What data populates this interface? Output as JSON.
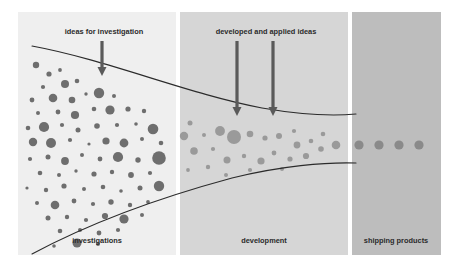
{
  "figure": {
    "background": "#ffffff"
  },
  "panels": [
    {
      "id": "investigations",
      "label": "investigations",
      "fill": "#efefef",
      "x": 0,
      "y": 0,
      "width": 158,
      "height": 243,
      "label_x": 79,
      "label_y": 231
    },
    {
      "id": "development",
      "label": "development",
      "fill": "#d6d6d6",
      "x": 162,
      "y": 0,
      "width": 168,
      "height": 243,
      "label_x": 246,
      "label_y": 231
    },
    {
      "id": "shipping-products",
      "label": "shipping products",
      "fill": "#bdbdbd",
      "x": 334,
      "y": 0,
      "width": 89,
      "height": 243,
      "label_x": 378,
      "label_y": 231
    }
  ],
  "annotations": [
    {
      "id": "ideas-for-investigation",
      "text": "ideas for investigation",
      "text_x": 86,
      "text_y": 22,
      "arrows": [
        {
          "x": 84,
          "y1": 29,
          "y2": 64
        }
      ]
    },
    {
      "id": "developed-and-applied-ideas",
      "text": "developed and applied ideas",
      "text_x": 248,
      "text_y": 22,
      "arrows": [
        {
          "x": 219,
          "y1": 29,
          "y2": 104
        },
        {
          "x": 255,
          "y1": 29,
          "y2": 104
        }
      ]
    }
  ],
  "funnel": {
    "stroke": "#2b2b2b",
    "stroke_width": 1.1,
    "top_curve": "M 14,34 C 90,48 170,82 244,96 C 290,104 316,104 338,102",
    "bottom_curve": "M 14,242 C 70,212 140,186 214,166 C 262,154 308,150 338,151"
  },
  "arrow_style": {
    "color": "#5a5a5a",
    "shaft_width": 3.2,
    "head_width": 9,
    "head_height": 9
  },
  "circles": {
    "investigations": {
      "fill": "#6e6e6e",
      "items": [
        {
          "cx": 18,
          "cy": 53,
          "r": 3.2
        },
        {
          "cx": 31,
          "cy": 62,
          "r": 2.6
        },
        {
          "cx": 42,
          "cy": 58,
          "r": 1.9
        },
        {
          "cx": 25,
          "cy": 75,
          "r": 2.1
        },
        {
          "cx": 47,
          "cy": 72,
          "r": 4.0
        },
        {
          "cx": 59,
          "cy": 69,
          "r": 2.3
        },
        {
          "cx": 14,
          "cy": 88,
          "r": 2.4
        },
        {
          "cx": 35,
          "cy": 86,
          "r": 4.3
        },
        {
          "cx": 54,
          "cy": 88,
          "r": 3.3
        },
        {
          "cx": 68,
          "cy": 82,
          "r": 1.7
        },
        {
          "cx": 81,
          "cy": 81,
          "r": 5.2
        },
        {
          "cx": 96,
          "cy": 84,
          "r": 2.0
        },
        {
          "cx": 20,
          "cy": 101,
          "r": 2.0
        },
        {
          "cx": 40,
          "cy": 100,
          "r": 2.4
        },
        {
          "cx": 57,
          "cy": 103,
          "r": 4.1
        },
        {
          "cx": 76,
          "cy": 97,
          "r": 2.3
        },
        {
          "cx": 92,
          "cy": 98,
          "r": 4.6
        },
        {
          "cx": 110,
          "cy": 97,
          "r": 2.6
        },
        {
          "cx": 126,
          "cy": 99,
          "r": 2.2
        },
        {
          "cx": 10,
          "cy": 116,
          "r": 2.3
        },
        {
          "cx": 26,
          "cy": 115,
          "r": 5.1
        },
        {
          "cx": 44,
          "cy": 113,
          "r": 2.1
        },
        {
          "cx": 60,
          "cy": 118,
          "r": 2.5
        },
        {
          "cx": 79,
          "cy": 114,
          "r": 2.8
        },
        {
          "cx": 99,
          "cy": 113,
          "r": 2.1
        },
        {
          "cx": 118,
          "cy": 112,
          "r": 1.8
        },
        {
          "cx": 135,
          "cy": 117,
          "r": 5.3
        },
        {
          "cx": 15,
          "cy": 130,
          "r": 4.2
        },
        {
          "cx": 33,
          "cy": 131,
          "r": 5.0
        },
        {
          "cx": 52,
          "cy": 128,
          "r": 2.1
        },
        {
          "cx": 71,
          "cy": 132,
          "r": 1.6
        },
        {
          "cx": 88,
          "cy": 129,
          "r": 3.6
        },
        {
          "cx": 106,
          "cy": 131,
          "r": 4.4
        },
        {
          "cx": 124,
          "cy": 127,
          "r": 2.0
        },
        {
          "cx": 143,
          "cy": 131,
          "r": 2.3
        },
        {
          "cx": 12,
          "cy": 147,
          "r": 2.1
        },
        {
          "cx": 30,
          "cy": 145,
          "r": 2.5
        },
        {
          "cx": 47,
          "cy": 149,
          "r": 3.9
        },
        {
          "cx": 64,
          "cy": 143,
          "r": 2.0
        },
        {
          "cx": 82,
          "cy": 147,
          "r": 2.4
        },
        {
          "cx": 100,
          "cy": 145,
          "r": 5.1
        },
        {
          "cx": 120,
          "cy": 148,
          "r": 2.7
        },
        {
          "cx": 141,
          "cy": 146,
          "r": 6.8
        },
        {
          "cx": 22,
          "cy": 161,
          "r": 2.3
        },
        {
          "cx": 41,
          "cy": 163,
          "r": 2.0
        },
        {
          "cx": 58,
          "cy": 159,
          "r": 1.7
        },
        {
          "cx": 76,
          "cy": 162,
          "r": 2.6
        },
        {
          "cx": 94,
          "cy": 160,
          "r": 2.2
        },
        {
          "cx": 113,
          "cy": 163,
          "r": 2.9
        },
        {
          "cx": 132,
          "cy": 161,
          "r": 2.1
        },
        {
          "cx": 9,
          "cy": 176,
          "r": 1.6
        },
        {
          "cx": 28,
          "cy": 178,
          "r": 2.2
        },
        {
          "cx": 46,
          "cy": 174,
          "r": 2.6
        },
        {
          "cx": 66,
          "cy": 177,
          "r": 2.0
        },
        {
          "cx": 85,
          "cy": 175,
          "r": 2.3
        },
        {
          "cx": 103,
          "cy": 179,
          "r": 1.8
        },
        {
          "cx": 122,
          "cy": 176,
          "r": 2.5
        },
        {
          "cx": 141,
          "cy": 174,
          "r": 5.2
        },
        {
          "cx": 19,
          "cy": 191,
          "r": 2.0
        },
        {
          "cx": 37,
          "cy": 193,
          "r": 4.3
        },
        {
          "cx": 56,
          "cy": 189,
          "r": 2.4
        },
        {
          "cx": 75,
          "cy": 192,
          "r": 2.1
        },
        {
          "cx": 93,
          "cy": 190,
          "r": 2.7
        },
        {
          "cx": 112,
          "cy": 193,
          "r": 2.2
        },
        {
          "cx": 130,
          "cy": 190,
          "r": 1.9
        },
        {
          "cx": 30,
          "cy": 206,
          "r": 2.5
        },
        {
          "cx": 49,
          "cy": 205,
          "r": 2.2
        },
        {
          "cx": 68,
          "cy": 208,
          "r": 2.1
        },
        {
          "cx": 87,
          "cy": 204,
          "r": 3.1
        },
        {
          "cx": 106,
          "cy": 207,
          "r": 4.6
        },
        {
          "cx": 124,
          "cy": 203,
          "r": 2.0
        },
        {
          "cx": 42,
          "cy": 219,
          "r": 2.3
        },
        {
          "cx": 62,
          "cy": 218,
          "r": 2.0
        },
        {
          "cx": 81,
          "cy": 221,
          "r": 2.4
        },
        {
          "cx": 100,
          "cy": 218,
          "r": 2.1
        },
        {
          "cx": 59,
          "cy": 231,
          "r": 4.5
        },
        {
          "cx": 80,
          "cy": 232,
          "r": 2.0
        },
        {
          "cx": 36,
          "cy": 234,
          "r": 1.8
        }
      ]
    },
    "development": {
      "fill": "#9a9a9a",
      "items": [
        {
          "cx": 172,
          "cy": 111,
          "r": 2.5
        },
        {
          "cx": 166,
          "cy": 124,
          "r": 4.2
        },
        {
          "cx": 186,
          "cy": 123,
          "r": 2.0
        },
        {
          "cx": 202,
          "cy": 119,
          "r": 4.9
        },
        {
          "cx": 176,
          "cy": 139,
          "r": 3.8
        },
        {
          "cx": 195,
          "cy": 137,
          "r": 2.1
        },
        {
          "cx": 216,
          "cy": 125,
          "r": 7.0
        },
        {
          "cx": 232,
          "cy": 122,
          "r": 3.3
        },
        {
          "cx": 247,
          "cy": 126,
          "r": 2.6
        },
        {
          "cx": 209,
          "cy": 148,
          "r": 3.5
        },
        {
          "cx": 226,
          "cy": 144,
          "r": 2.2
        },
        {
          "cx": 243,
          "cy": 149,
          "r": 3.6
        },
        {
          "cx": 261,
          "cy": 124,
          "r": 3.0
        },
        {
          "cx": 256,
          "cy": 141,
          "r": 2.4
        },
        {
          "cx": 272,
          "cy": 147,
          "r": 2.6
        },
        {
          "cx": 264,
          "cy": 157,
          "r": 2.0
        },
        {
          "cx": 279,
          "cy": 133,
          "r": 3.4
        },
        {
          "cx": 293,
          "cy": 129,
          "r": 2.3
        },
        {
          "cx": 288,
          "cy": 144,
          "r": 3.1
        },
        {
          "cx": 303,
          "cy": 137,
          "r": 2.8
        },
        {
          "cx": 170,
          "cy": 158,
          "r": 1.9
        },
        {
          "cx": 190,
          "cy": 155,
          "r": 2.2
        },
        {
          "cx": 232,
          "cy": 158,
          "r": 2.1
        },
        {
          "cx": 208,
          "cy": 163,
          "r": 2.0
        },
        {
          "cx": 305,
          "cy": 122,
          "r": 2.3
        },
        {
          "cx": 318,
          "cy": 133,
          "r": 4.3
        },
        {
          "cx": 276,
          "cy": 119,
          "r": 2.1
        }
      ]
    },
    "shipping": {
      "fill": "#8a8a8a",
      "items": [
        {
          "cx": 341,
          "cy": 133,
          "r": 4.6
        },
        {
          "cx": 361,
          "cy": 133,
          "r": 4.6
        },
        {
          "cx": 381,
          "cy": 133,
          "r": 4.6
        },
        {
          "cx": 401,
          "cy": 133,
          "r": 4.6
        }
      ]
    }
  }
}
